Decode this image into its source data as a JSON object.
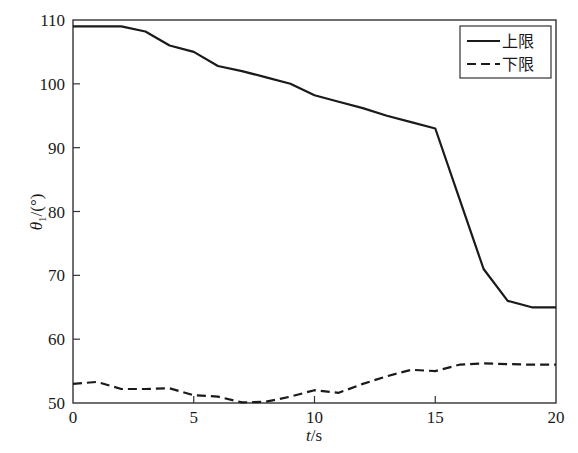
{
  "chart_data": {
    "type": "line",
    "title": "",
    "xlabel": "t/s",
    "xlabel_italic_part": "t",
    "xlabel_rest": "/s",
    "ylabel": "θ1/(°)",
    "xlim": [
      0,
      20
    ],
    "ylim": [
      50,
      110
    ],
    "xticks": [
      0,
      5,
      10,
      15,
      20
    ],
    "yticks": [
      50,
      60,
      70,
      80,
      90,
      100,
      110
    ],
    "grid": false,
    "legend_position": "upper right",
    "series": [
      {
        "name": "上限",
        "style": "solid",
        "x": [
          0,
          1,
          2,
          3,
          4,
          5,
          6,
          7,
          8,
          9,
          10,
          11,
          12,
          13,
          14,
          15,
          16,
          17,
          18,
          19,
          20
        ],
        "values": [
          109,
          109,
          109,
          108.2,
          106,
          105,
          102.8,
          102,
          101,
          100,
          98.2,
          97.2,
          96.2,
          95,
          94,
          93,
          82,
          71,
          66,
          65,
          65
        ]
      },
      {
        "name": "下限",
        "style": "dashed",
        "x": [
          0,
          1,
          2,
          3,
          4,
          5,
          6,
          7,
          8,
          9,
          10,
          11,
          12,
          13,
          14,
          15,
          16,
          17,
          18,
          19,
          20
        ],
        "values": [
          53,
          53.3,
          52.2,
          52.2,
          52.3,
          51.2,
          51,
          50.1,
          50.2,
          51,
          52,
          51.6,
          53,
          54.2,
          55.2,
          55,
          56,
          56.2,
          56.1,
          56,
          56
        ]
      }
    ]
  },
  "legend": {
    "items": [
      {
        "label": "上限",
        "style": "solid"
      },
      {
        "label": "下限",
        "style": "dashed"
      }
    ]
  },
  "colors": {
    "line": "#1a1a1a",
    "axis": "#333333",
    "background": "#ffffff"
  }
}
